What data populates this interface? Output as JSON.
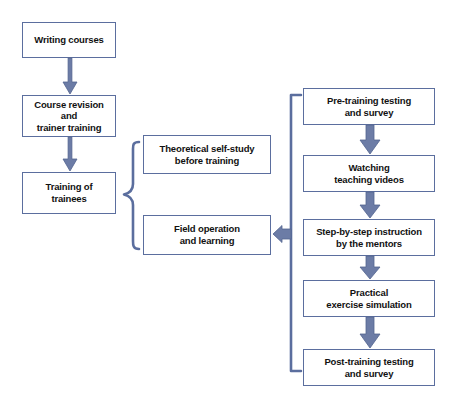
{
  "diagram": {
    "colors": {
      "box_border": "#5b6e9e",
      "arrow": "#5b6e9e",
      "brace": "#5b6e9e",
      "background": "#ffffff",
      "text": "#111111"
    },
    "left_column": [
      {
        "id": "writing-courses",
        "label": "Writing courses"
      },
      {
        "id": "course-revision",
        "label": "Course revision\nand\ntrainer training"
      },
      {
        "id": "training-of-trainees",
        "label": "Training of\ntrainees"
      }
    ],
    "middle_column": [
      {
        "id": "theoretical-self-study",
        "label": "Theoretical self-study\nbefore training"
      },
      {
        "id": "field-operation",
        "label": "Field operation\nand learning"
      }
    ],
    "right_column": [
      {
        "id": "pre-training-testing",
        "label": "Pre-training testing\nand survey"
      },
      {
        "id": "watching-teaching-videos",
        "label": "Watching\nteaching videos"
      },
      {
        "id": "step-by-step-instruction",
        "label": "Step-by-step instruction\nby the mentors"
      },
      {
        "id": "practical-exercise",
        "label": "Practical\nexercise simulation"
      },
      {
        "id": "post-training-testing",
        "label": "Post-training testing\nand survey"
      }
    ],
    "connectors": {
      "arrow_writing_to_revision": "down-arrow",
      "arrow_revision_to_training": "down-arrow",
      "brace_trainees_to_middle": "left-curly-brace",
      "bracket_right_to_field": "left-square-bracket-with-arrow",
      "arrow_pre_to_watching": "down-arrow",
      "arrow_watching_to_step": "down-arrow",
      "arrow_step_to_practical": "down-arrow",
      "arrow_practical_to_post": "down-arrow"
    }
  }
}
